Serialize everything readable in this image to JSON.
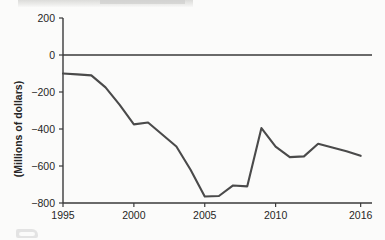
{
  "chart_data": {
    "type": "line",
    "title": "",
    "xlabel": "",
    "ylabel": "(Millions of dollars)",
    "xlim": [
      1995,
      2016.8
    ],
    "ylim": [
      -800,
      200
    ],
    "yticks": [
      200,
      0,
      -200,
      -400,
      -600,
      -800
    ],
    "ytick_labels": [
      "200",
      "0",
      "−200",
      "−400",
      "−600",
      "−800"
    ],
    "xticks": [
      1995,
      2000,
      2005,
      2010,
      2016
    ],
    "xtick_labels": [
      "1995",
      "2000",
      "2005",
      "2010",
      "2016"
    ],
    "grid": false,
    "legend": false,
    "zero_line": true,
    "series": [
      {
        "name": "balance",
        "color": "#4a4a4a",
        "x": [
          1995,
          1996,
          1997,
          1998,
          1999,
          2000,
          2001,
          2002,
          2003,
          2004,
          2005,
          2006,
          2007,
          2008,
          2009,
          2010,
          2011,
          2012,
          2013,
          2014,
          2015,
          2016
        ],
        "values": [
          -100,
          -105,
          -110,
          -175,
          -270,
          -375,
          -365,
          -430,
          -495,
          -620,
          -765,
          -762,
          -705,
          -710,
          -395,
          -495,
          -552,
          -548,
          -480,
          -500,
          -520,
          -545
        ]
      }
    ]
  },
  "axis": {
    "y_title": "(Millions of dollars)"
  }
}
